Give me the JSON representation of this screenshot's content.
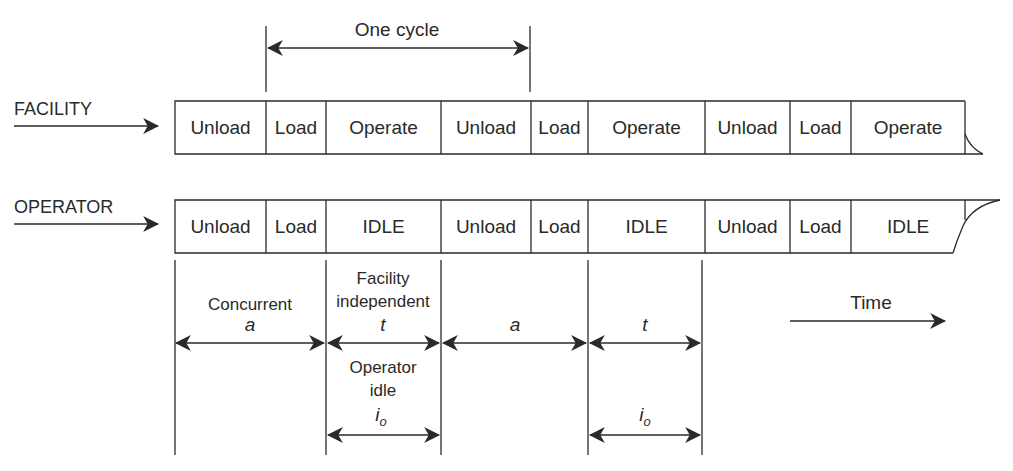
{
  "diagram": {
    "cycle_label": "One cycle",
    "time_label": "Time",
    "colors": {
      "ink": "#2a2a2a",
      "background": "#ffffff"
    },
    "rows": [
      {
        "name": "FACILITY",
        "label": "FACILITY",
        "segments": [
          "Unload",
          "Load",
          "Operate",
          "Unload",
          "Load",
          "Operate",
          "Unload",
          "Load",
          "Operate"
        ]
      },
      {
        "name": "OPERATOR",
        "label": "OPERATOR",
        "segments": [
          "Unload",
          "Load",
          "IDLE",
          "Unload",
          "Load",
          "IDLE",
          "Unload",
          "Load",
          "IDLE"
        ]
      }
    ],
    "annotations": {
      "concurrent": {
        "label": "Concurrent",
        "symbol": "a"
      },
      "facility_independent": {
        "label_line1": "Facility",
        "label_line2": "independent",
        "symbol": "t"
      },
      "second_concurrent": {
        "symbol": "a"
      },
      "second_independent": {
        "symbol": "t"
      },
      "operator_idle": {
        "label_line1": "Operator",
        "label_line2": "idle",
        "symbol": "i",
        "subscript": "o"
      },
      "second_operator_idle": {
        "symbol": "i",
        "subscript": "o"
      }
    }
  }
}
